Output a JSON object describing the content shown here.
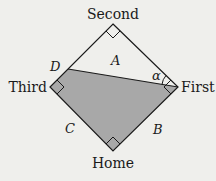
{
  "diagram": {
    "bases": {
      "second": "Second",
      "first": "First",
      "third": "Third",
      "home": "Home"
    },
    "labels": {
      "point_d": "D",
      "region_a": "A",
      "side_b": "B",
      "side_c": "C",
      "angle": "α"
    },
    "colors": {
      "background": "#efefec",
      "shaded": "#a8a8a8",
      "line": "#1a1a1a"
    }
  }
}
